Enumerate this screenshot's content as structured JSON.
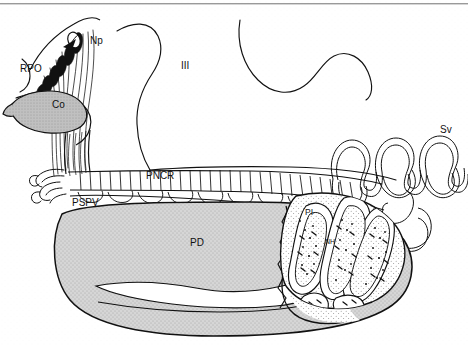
{
  "figure": {
    "background_color": "#ffffff",
    "line_color": "#111111",
    "top_rule_color": "#9a9a9a",
    "fill_pd": "#c9c9c9",
    "fill_co": "#b0b0b0",
    "fill_pi": "#ffffff",
    "width": 468,
    "height": 345
  },
  "labels": {
    "np": "Np",
    "rpo": "RPO",
    "co": "Co",
    "third_ventricle": "III",
    "sv": "Sv",
    "pncr": "PNCR",
    "pspv": "PSPV",
    "pd": "PD",
    "pi": "PI",
    "nh": "NH"
  },
  "label_positions": {
    "np": {
      "x": 90,
      "y": 44
    },
    "rpo": {
      "x": 20,
      "y": 72
    },
    "co": {
      "x": 52,
      "y": 108
    },
    "third_ventricle": {
      "x": 181,
      "y": 69
    },
    "sv": {
      "x": 440,
      "y": 133
    },
    "pncr": {
      "x": 146,
      "y": 179
    },
    "pspv": {
      "x": 72,
      "y": 206
    },
    "pd": {
      "x": 190,
      "y": 246
    },
    "pi": {
      "x": 305,
      "y": 215
    },
    "nh": {
      "x": 325,
      "y": 244
    }
  }
}
